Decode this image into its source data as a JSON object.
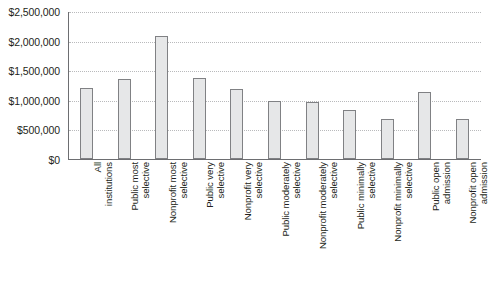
{
  "chart_data": {
    "type": "bar",
    "title": "",
    "subtitle": "",
    "xlabel": "",
    "ylabel": "",
    "ylim": [
      0,
      2500000
    ],
    "grid": true,
    "legend": false,
    "y_ticks": [
      {
        "value": 2500000,
        "label": "$2,500,000"
      },
      {
        "value": 2000000,
        "label": "$2,000,000"
      },
      {
        "value": 1500000,
        "label": "$1,500,000"
      },
      {
        "value": 1000000,
        "label": "$1,000,000"
      },
      {
        "value": 500000,
        "label": "$500,000"
      },
      {
        "value": 0,
        "label": "$0"
      }
    ],
    "categories": [
      "All\ninstitutions",
      "Public most\nselective",
      "Nonprofit most\nselective",
      "Public very\nselective",
      "Nonprofit very\nselective",
      "Public moderately\nselective",
      "Nonprofit moderately\nselective",
      "Public minimally\nselective",
      "Nonprofit minimally\nselective",
      "Public open\nadmission",
      "Nonprofit open\nadmission"
    ],
    "values": [
      1200000,
      1350000,
      2080000,
      1370000,
      1190000,
      980000,
      960000,
      820000,
      680000,
      1130000,
      680000
    ],
    "colors": {
      "bar_fill": "#e6e7e8",
      "bar_stroke": "#808184",
      "axis": "#6d6e71",
      "gridline": "#b9babc",
      "text": "#231f20",
      "background": "#ffffff"
    }
  }
}
